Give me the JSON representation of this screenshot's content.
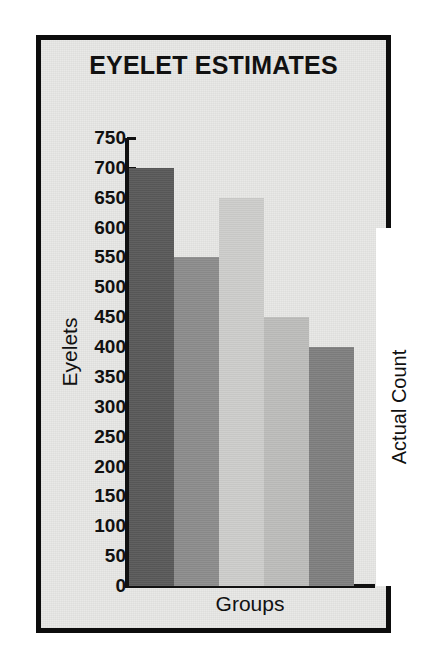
{
  "chart_data": {
    "type": "bar",
    "title": "EYELET ESTIMATES",
    "xlabel": "Groups",
    "ylabel": "Eyelets",
    "categories": [
      "Group 1",
      "Group 2",
      "Group 3",
      "Group 4",
      "Group 5",
      "Actual Count"
    ],
    "values": [
      700,
      550,
      650,
      450,
      400,
      600
    ],
    "ylim": [
      0,
      750
    ],
    "ytick_labels": [
      "750",
      "700",
      "650",
      "600",
      "550",
      "500",
      "450",
      "400",
      "350",
      "300",
      "250",
      "200",
      "150",
      "100",
      "50",
      "0"
    ],
    "ytick_values": [
      750,
      700,
      650,
      600,
      550,
      500,
      450,
      400,
      350,
      300,
      250,
      200,
      150,
      100,
      50,
      0
    ],
    "xtick_labels": [],
    "grid": false,
    "legend": "none",
    "bars": [
      {
        "label": "Group 1",
        "value": 700,
        "color": "#595959",
        "annotation": ""
      },
      {
        "label": "Group 2",
        "value": 550,
        "color": "#8c8c8c",
        "annotation": ""
      },
      {
        "label": "Group 3",
        "value": 650,
        "color": "#cdcdcb",
        "annotation": ""
      },
      {
        "label": "Group 4",
        "value": 450,
        "color": "#bdbdbb",
        "annotation": ""
      },
      {
        "label": "Group 5",
        "value": 400,
        "color": "#7f7f7f",
        "annotation": ""
      },
      {
        "label": "Actual Count",
        "value": 600,
        "color": "#ffffff",
        "annotation": "Actual Count"
      }
    ]
  },
  "figure": {
    "background_color": "#e9e9e7",
    "border_color": "#0d0d0d",
    "axis_color": "#111111",
    "text_color": "#111111"
  }
}
